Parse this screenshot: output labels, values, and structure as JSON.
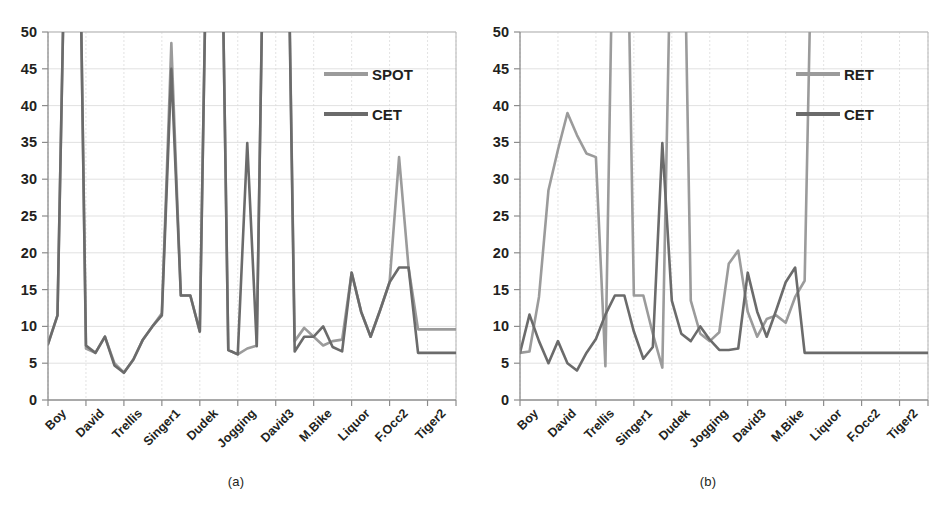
{
  "figure": {
    "panels": [
      {
        "caption": "(a)",
        "legend": [
          {
            "name": "SPOT",
            "color": "#9b9b9b"
          },
          {
            "name": "CET",
            "color": "#6b6b6b"
          }
        ]
      },
      {
        "caption": "(b)",
        "legend": [
          {
            "name": "RET",
            "color": "#9b9b9b"
          },
          {
            "name": "CET",
            "color": "#6b6b6b"
          }
        ]
      }
    ]
  },
  "chart_data": [
    {
      "type": "line",
      "title": "",
      "panel": "(a)",
      "xlabel": "",
      "ylabel": "",
      "ylim": [
        0,
        50
      ],
      "ytick_step": 5,
      "yticks": [
        0,
        5,
        10,
        15,
        20,
        25,
        30,
        35,
        40,
        45,
        50
      ],
      "grid": true,
      "legend_position": "top-right",
      "clipped_above": 50,
      "categories": [
        "Boy",
        "David",
        "Trellis",
        "Singer1",
        "Dudek",
        "Jogging",
        "David3",
        "M.Bike",
        "Liquor",
        "F.Occ2",
        "Tiger2"
      ],
      "points_per_category": 4,
      "x": [
        0,
        1,
        2,
        3,
        4,
        5,
        6,
        7,
        8,
        9,
        10,
        11,
        12,
        13,
        14,
        15,
        16,
        17,
        18,
        19,
        20,
        21,
        22,
        23,
        24,
        25,
        26,
        27,
        28,
        29,
        30,
        31,
        32,
        33,
        34,
        35,
        36,
        37,
        38,
        39,
        40,
        41,
        42,
        43
      ],
      "series": [
        {
          "name": "SPOT",
          "color": "#9b9b9b",
          "values": [
            7.6,
            11.5,
            78,
            95,
            7.0,
            6.4,
            8.6,
            5.0,
            3.7,
            5.5,
            8.2,
            10.0,
            11.8,
            48.5,
            14.2,
            14.2,
            9.3,
            86,
            92,
            6.8,
            6.2,
            7.0,
            7.4,
            88,
            94,
            90,
            8.0,
            9.8,
            8.6,
            7.4,
            8.0,
            8.2,
            17.3,
            12.0,
            8.6,
            12.2,
            16.0,
            33.0,
            18.0,
            9.6,
            9.6,
            9.6,
            9.6,
            9.6
          ]
        },
        {
          "name": "CET",
          "color": "#6b6b6b",
          "values": [
            7.6,
            11.5,
            78,
            95,
            7.4,
            6.4,
            8.6,
            4.7,
            3.7,
            5.5,
            8.2,
            10.0,
            11.5,
            45.0,
            14.2,
            14.2,
            9.3,
            86,
            92,
            6.8,
            6.2,
            34.9,
            7.3,
            88,
            94,
            90,
            6.6,
            8.6,
            8.6,
            10.0,
            7.2,
            6.6,
            17.3,
            12.0,
            8.6,
            12.2,
            16.0,
            18.0,
            18.0,
            6.4,
            6.4,
            6.4,
            6.4,
            6.4
          ]
        }
      ]
    },
    {
      "type": "line",
      "title": "",
      "panel": "(b)",
      "xlabel": "",
      "ylabel": "",
      "ylim": [
        0,
        50
      ],
      "ytick_step": 5,
      "yticks": [
        0,
        5,
        10,
        15,
        20,
        25,
        30,
        35,
        40,
        45,
        50
      ],
      "grid": true,
      "legend_position": "top-right",
      "clipped_above": 50,
      "categories": [
        "Boy",
        "David",
        "Trellis",
        "Singer1",
        "Dudek",
        "Jogging",
        "David3",
        "M.Bike",
        "Liquor",
        "F.Occ2",
        "Tiger2"
      ],
      "points_per_category": 4,
      "x": [
        0,
        1,
        2,
        3,
        4,
        5,
        6,
        7,
        8,
        9,
        10,
        11,
        12,
        13,
        14,
        15,
        16,
        17,
        18,
        19,
        20,
        21,
        22,
        23,
        24,
        25,
        26,
        27,
        28,
        29,
        30,
        31,
        32,
        33,
        34,
        35,
        36,
        37,
        38,
        39,
        40,
        41,
        42,
        43
      ],
      "series": [
        {
          "name": "RET",
          "color": "#9b9b9b",
          "values": [
            6.4,
            6.6,
            14.0,
            28.5,
            34.0,
            39.0,
            36.0,
            33.5,
            33.0,
            4.6,
            80,
            90,
            14.2,
            14.2,
            9.0,
            4.4,
            70,
            88,
            13.5,
            9.0,
            8.0,
            9.2,
            18.5,
            20.3,
            12.0,
            8.6,
            11.0,
            11.5,
            10.5,
            14.0,
            16.2,
            80,
            90,
            90,
            88,
            86,
            84,
            82,
            80,
            78,
            76,
            74,
            72,
            70
          ]
        },
        {
          "name": "CET",
          "color": "#6b6b6b",
          "values": [
            6.4,
            11.6,
            8.0,
            5.0,
            8.0,
            5.0,
            4.0,
            6.4,
            8.3,
            11.6,
            14.2,
            14.2,
            9.3,
            5.6,
            7.2,
            34.9,
            13.5,
            9.0,
            8.0,
            10.0,
            8.2,
            6.8,
            6.8,
            7.0,
            17.3,
            12.0,
            8.6,
            12.2,
            16.0,
            18.0,
            6.4,
            6.4,
            6.4,
            6.4,
            6.4,
            6.4,
            6.4,
            6.4,
            6.4,
            6.4,
            6.4,
            6.4,
            6.4,
            6.4
          ]
        }
      ]
    }
  ]
}
